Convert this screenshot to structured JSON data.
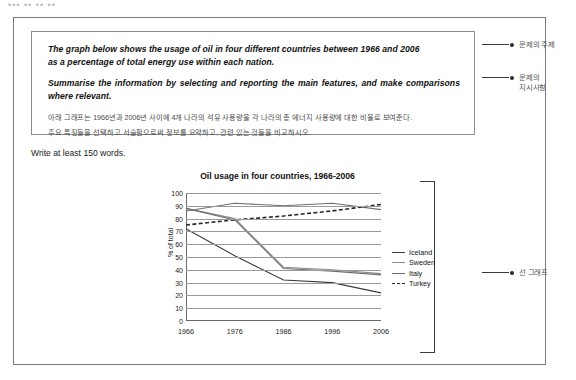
{
  "top_strip": "••• •• •• ••",
  "prompt": {
    "english_line_1": "The graph below shows the usage of oil in four different countries between 1966 and 2006",
    "english_line_2": "as a percentage of total energy use within each nation.",
    "english_line_3": "Summarise the information by selecting and reporting the main features, and make comparisons where relevant.",
    "korean_line_1": "아래 그래프는 1966년과 2006년 사이에 4개 나라의 석유 사용량을 각 나라의 총 에너지 사용량에 대한 비율로 보여준다.",
    "korean_line_2": "주요 특징들을 선택하고 서술함으로써 정보를 요약하고, 관련 있는 것들을 비교하시오."
  },
  "annotations": {
    "topic": "문제의 주제",
    "instruction": "문제의\n지시사항",
    "line_graph": "선 그래프"
  },
  "word_count_note": "Write at least 150 words.",
  "chart_data": {
    "type": "line",
    "title": "Oil usage in four countries, 1966-2006",
    "xlabel": "",
    "ylabel": "% of total",
    "categories": [
      "1966",
      "1976",
      "1986",
      "1996",
      "2006"
    ],
    "x": [
      1966,
      1976,
      1986,
      1996,
      2006
    ],
    "ylim": [
      0,
      100
    ],
    "ytick_labels": [
      "0",
      "10",
      "20",
      "30",
      "40",
      "50",
      "60",
      "70",
      "80",
      "90",
      "100"
    ],
    "ytick_values": [
      0,
      10,
      20,
      30,
      40,
      50,
      60,
      70,
      80,
      90,
      100
    ],
    "grid": true,
    "legend_position": "right",
    "series": [
      {
        "name": "Iceland",
        "values": [
          72,
          51,
          32,
          30,
          22
        ],
        "style": "solid",
        "color": "#3d3d3d"
      },
      {
        "name": "Sweden",
        "values": [
          88,
          80,
          42,
          40,
          37
        ],
        "style": "solid",
        "color": "#8a8a8a"
      },
      {
        "name": "Italy",
        "values": [
          88,
          79,
          41,
          39,
          36
        ],
        "style": "solid",
        "color": "#6f6f6f"
      },
      {
        "name": "Turkey",
        "values": [
          75,
          79,
          82,
          86,
          91
        ],
        "style": "dashed",
        "color": "#2a2a2a"
      }
    ],
    "top_solid_series": {
      "name": "top-band",
      "values": [
        86,
        92,
        90,
        92,
        87
      ],
      "style": "solid",
      "color": "#6f6f6f"
    }
  }
}
